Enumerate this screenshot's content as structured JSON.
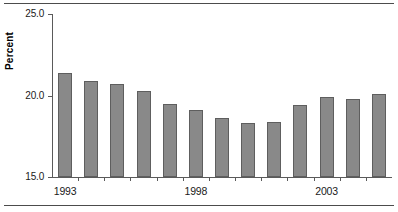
{
  "chart_data": {
    "type": "bar",
    "title": "",
    "subtitle": "",
    "xlabel": "",
    "ylabel": "Percent",
    "ylim": [
      15.0,
      25.0
    ],
    "yticks": [
      "25.0",
      "20.0",
      "15.0"
    ],
    "ytick_values": [
      25.0,
      20.0,
      15.0
    ],
    "grid": false,
    "legend": null,
    "bar_color": "#898989",
    "bar_edge_color": "#5e5e5e",
    "axis_color": "#5a5a5a",
    "categories": [
      "1993",
      "1994",
      "1995",
      "1996",
      "1997",
      "1998",
      "1999",
      "2000",
      "2001",
      "2002",
      "2003",
      "2004",
      "2005"
    ],
    "values": [
      21.4,
      20.9,
      20.7,
      20.3,
      19.5,
      19.1,
      18.6,
      18.3,
      18.4,
      19.4,
      19.9,
      19.8,
      20.1
    ],
    "xtick_labels": [
      {
        "label": "1993",
        "category_index": 0
      },
      {
        "label": "1998",
        "category_index": 5
      },
      {
        "label": "2003",
        "category_index": 10
      }
    ]
  }
}
